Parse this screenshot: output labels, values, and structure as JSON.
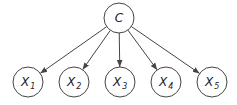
{
  "diagram": {
    "type": "bayesian-network",
    "root": {
      "id": "C",
      "label": "C",
      "cx": 119,
      "cy": 18,
      "r": 15
    },
    "children": [
      {
        "id": "X1",
        "label": "X",
        "subscript": "1",
        "cx": 28,
        "cy": 82,
        "r": 15
      },
      {
        "id": "X2",
        "label": "X",
        "subscript": "2",
        "cx": 74,
        "cy": 82,
        "r": 15
      },
      {
        "id": "X3",
        "label": "X",
        "subscript": "3",
        "cx": 120,
        "cy": 82,
        "r": 15
      },
      {
        "id": "X4",
        "label": "X",
        "subscript": "4",
        "cx": 166,
        "cy": 82,
        "r": 15
      },
      {
        "id": "X5",
        "label": "X",
        "subscript": "5",
        "cx": 212,
        "cy": 82,
        "r": 15
      }
    ],
    "edges": [
      {
        "from": "C",
        "to": "X1"
      },
      {
        "from": "C",
        "to": "X2"
      },
      {
        "from": "C",
        "to": "X3"
      },
      {
        "from": "C",
        "to": "X4"
      },
      {
        "from": "C",
        "to": "X5"
      }
    ],
    "colors": {
      "stroke": "#444444",
      "fill": "#ffffff",
      "text": "#222222"
    }
  }
}
